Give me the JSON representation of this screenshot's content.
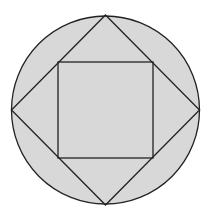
{
  "diagram": {
    "colors": {
      "fill": "#d8d8d8",
      "stroke": "#222222",
      "background": "#ffffff"
    },
    "circle": {
      "cx": 105.5,
      "cy": 110,
      "r": 94
    },
    "diamond": {
      "points": "105.5,15 199.5,110 105.5,205 11.5,110"
    },
    "inner_square": {
      "x": 58,
      "y": 62,
      "width": 95,
      "height": 96
    }
  }
}
